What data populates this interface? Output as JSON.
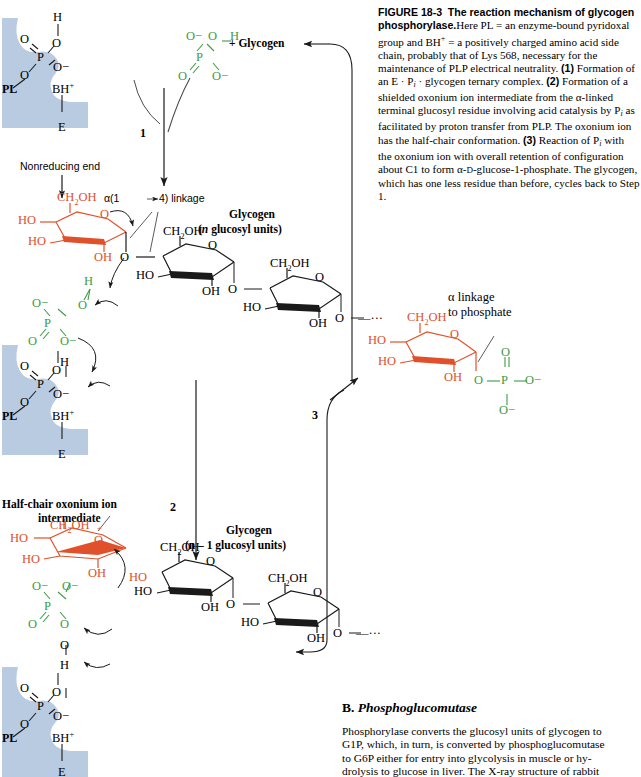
{
  "figure": {
    "number": "FIGURE 18-3",
    "title": "The reaction mechanism of glycogen phosphorylase.",
    "caption_body": "Here PL = an enzyme-bound pyridoxal group and BH+ = a positively charged amino acid side chain, probably that of Lys 568, necessary for the maintenance of PLP electrical neutrality. (1) Formation of an E · Pi · glycogen ternary complex. (2) Formation of a shielded oxonium ion intermediate from the α-linked terminal glucosyl residue involving acid catalysis by Pi as facilitated by proton transfer from PLP. The oxonium ion has the half-chair conformation. (3) Reaction of Pi with the oxonium ion with overall retention of configuration about C1 to form α-D-glucose-1-phosphate. The glycogen, which has one less residue than before, cycles back to Step 1."
  },
  "caption_parts": {
    "fig_no": "FIGURE 18-3",
    "title": "The reaction mechanism of glycogen phosphorylase.",
    "s1": "Here PL = an enzyme-bound pyridoxal group and BH",
    "s1b": "+",
    "s2": " = a positively charged amino acid side chain, probably that of Lys 568, necessary for the maintenance of PLP electrical neutrality. ",
    "step1": "(1)",
    "s3": " Formation of an E · P",
    "s3sub": "i",
    "s4": " · glycogen ternary complex. ",
    "step2": "(2)",
    "s5": " Formation of a shielded oxonium ion intermediate from the α-linked terminal glucosyl residue involving acid catalysis by P",
    "s5sub": "i",
    "s6": " as facilitated by proton transfer from PLP. The oxonium ion has the half-chair conformation. ",
    "step3": "(3)",
    "s7": " Reaction of P",
    "s7sub": "i",
    "s8": " with the oxonium ion with overall retention of configuration about C1 to form α-",
    "s8sc": "D",
    "s9": "-glucose-1-phosphate. The glycogen, which has one less residue than before, cycles back to Step 1."
  },
  "section_b": {
    "letter": "B.",
    "heading": "Phosphoglucomutase",
    "paragraph": "Phosphorylase converts the glucosyl units of glycogen to G1P, which, in turn, is converted by phosphoglucomutase to G6P either for entry into glycolysis in muscle or hy-",
    "line1": "Phosphorylase converts the glucosyl units of glycogen to",
    "line2": "G1P, which, in turn, is converted by phosphoglucomutase",
    "line3": "to G6P either for entry into glycolysis in muscle or hy-",
    "line4": "drolysis to glucose in liver. The X-ray structure of rabbit"
  },
  "diagram": {
    "labels": {
      "enzyme": "E",
      "pl": "PL",
      "bh_plus": "BH",
      "bh_sup": "+",
      "plus_glycogen": "+ Glycogen",
      "nonreducing_end": "Nonreducing end",
      "linkage": "4) linkage",
      "linkage_alpha": "α(1",
      "glycogen": "Glycogen",
      "n_glucosyl": "(n glucosyl units)",
      "n_glucosyl_italic_n": "n",
      "n_glucosyl_rest": " glucosyl units)",
      "n_minus_1_glucosyl": "(n – 1 glucosyl units)",
      "half_chair_line1": "Half-chair oxonium ion",
      "half_chair_line2": "intermediate",
      "alpha_linkage_l1": "α linkage",
      "alpha_linkage_l2": "to phosphate",
      "step_1": "1",
      "step_2": "2",
      "step_3": "3"
    },
    "atoms": {
      "O": "O",
      "O_minus": "O−",
      "P": "P",
      "H": "H",
      "OH": "OH",
      "HO": "HO",
      "CH2OH": "CH2OH",
      "ellipsis": "—···",
      "plus_charge": "+"
    },
    "colors": {
      "enzyme_fill": "#b9cbe0",
      "phosphate_green": "#3f9b46",
      "sugar_red": "#e0502a",
      "black": "#000000"
    }
  }
}
